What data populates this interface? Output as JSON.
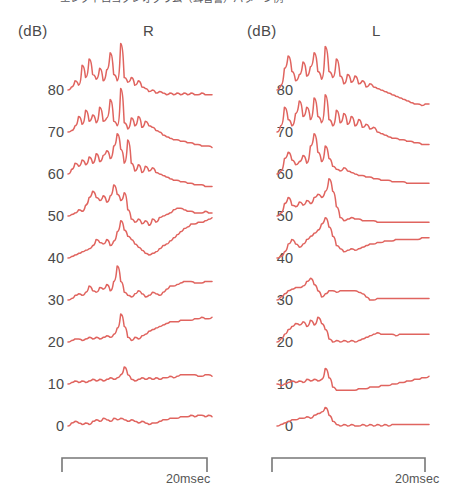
{
  "figure": {
    "caption_top": "エレクトロコクレオグラム（耳音響）パターン例",
    "unit_label": "(dB)",
    "trace_color": "#e0645f",
    "text_color": "#4a4a4a",
    "axis_color": "#777777"
  },
  "panels": [
    {
      "id": "right-ear",
      "ear_label": "R",
      "unit_label": "(dB)",
      "scale_caption": "20msec"
    },
    {
      "id": "left-ear",
      "ear_label": "L",
      "unit_label": "(dB)",
      "scale_caption": "20msec"
    }
  ],
  "chart_data": {
    "type": "line",
    "title": "",
    "xlabel": "",
    "ylabel": "(dB)",
    "grid": false,
    "legend": false,
    "x_scale_bar": {
      "label": "20msec",
      "duration_ms": 20
    },
    "y_tick_labels": [
      "80",
      "70",
      "60",
      "50",
      "40",
      "30",
      "20",
      "10",
      "0"
    ],
    "y_tick_values": [
      80,
      70,
      60,
      50,
      40,
      30,
      20,
      10,
      0
    ],
    "ylim": [
      0,
      80
    ],
    "series": [
      {
        "name": "R 80 dB",
        "panel": "right-ear",
        "level_db": 80,
        "values": [
          0,
          -2,
          -6,
          -3,
          -16,
          -8,
          -20,
          -10,
          -7,
          -14,
          -6,
          -13,
          -24,
          -10,
          -6,
          -30,
          -8,
          -5,
          -8,
          -3,
          -6,
          -2,
          -1,
          1,
          0,
          2,
          1,
          2,
          3,
          2,
          3,
          2,
          3,
          2,
          3,
          2,
          3,
          3,
          2,
          3,
          3,
          3
        ]
      },
      {
        "name": "R 70 dB",
        "panel": "right-ear",
        "level_db": 70,
        "values": [
          0,
          -1,
          -4,
          -10,
          -5,
          -14,
          -7,
          -11,
          -6,
          -16,
          -7,
          -9,
          -21,
          -7,
          -4,
          -28,
          -6,
          -2,
          -9,
          -4,
          -10,
          -3,
          -7,
          -4,
          -3,
          -1,
          0,
          2,
          3,
          4,
          5,
          5,
          6,
          6,
          7,
          7,
          8,
          8,
          9,
          9,
          9,
          10
        ]
      },
      {
        "name": "R 60 dB",
        "panel": "right-ear",
        "level_db": 60,
        "values": [
          0,
          -3,
          -7,
          -5,
          -9,
          -6,
          -11,
          -7,
          -13,
          -8,
          -12,
          -15,
          -10,
          -18,
          -26,
          -16,
          -7,
          -22,
          -7,
          -2,
          -6,
          -1,
          -5,
          -2,
          -4,
          -1,
          0,
          1,
          2,
          3,
          4,
          4,
          5,
          5,
          6,
          6,
          7,
          7,
          7,
          8,
          8,
          8
        ]
      },
      {
        "name": "R 50 dB",
        "panel": "right-ear",
        "level_db": 50,
        "values": [
          0,
          -1,
          -2,
          -4,
          -3,
          -7,
          -12,
          -16,
          -12,
          -10,
          -13,
          -9,
          -13,
          -20,
          -14,
          -10,
          -15,
          -4,
          2,
          4,
          2,
          5,
          3,
          6,
          2,
          4,
          1,
          0,
          -1,
          -2,
          -4,
          -5,
          -5,
          -4,
          -3,
          -3,
          -2,
          -2,
          -2,
          -3,
          -2,
          -2
        ]
      },
      {
        "name": "R 40 dB",
        "panel": "right-ear",
        "level_db": 40,
        "values": [
          0,
          -1,
          -2,
          -3,
          -4,
          -5,
          -6,
          -8,
          -12,
          -10,
          -9,
          -12,
          -8,
          -11,
          -17,
          -24,
          -18,
          -14,
          -12,
          -9,
          -7,
          -5,
          -3,
          -2,
          -3,
          -4,
          -6,
          -8,
          -9,
          -11,
          -13,
          -15,
          -17,
          -19,
          -20,
          -22,
          -22,
          -23,
          -23,
          -24,
          -25,
          -26
        ]
      },
      {
        "name": "R 30 dB",
        "panel": "right-ear",
        "level_db": 30,
        "values": [
          0,
          -1,
          -3,
          -4,
          -3,
          -5,
          -9,
          -6,
          -5,
          -8,
          -7,
          -10,
          -6,
          -12,
          -22,
          -12,
          -5,
          -3,
          -2,
          -4,
          -6,
          -4,
          -2,
          -3,
          -5,
          -4,
          -3,
          -5,
          -7,
          -9,
          -9,
          -10,
          -11,
          -12,
          -12,
          -12,
          -11,
          -11,
          -11,
          -12,
          -12,
          -12
        ]
      },
      {
        "name": "R 20 dB",
        "panel": "right-ear",
        "level_db": 20,
        "values": [
          0,
          -1,
          -2,
          -2,
          -1,
          -2,
          -3,
          -2,
          -3,
          -2,
          -3,
          -4,
          -3,
          -5,
          -9,
          -18,
          -10,
          -3,
          -1,
          -3,
          -2,
          -4,
          -5,
          -7,
          -8,
          -9,
          -10,
          -11,
          -12,
          -13,
          -13,
          -13,
          -14,
          -14,
          -14,
          -14,
          -15,
          -15,
          -16,
          -15,
          -15,
          -16
        ]
      },
      {
        "name": "R 10 dB",
        "panel": "right-ear",
        "level_db": 10,
        "values": [
          0,
          -1,
          -2,
          -1,
          -2,
          -1,
          -2,
          -3,
          -2,
          -3,
          -2,
          -3,
          -4,
          -3,
          -4,
          -6,
          -11,
          -6,
          -3,
          -2,
          -3,
          -4,
          -3,
          -4,
          -3,
          -4,
          -3,
          -4,
          -4,
          -5,
          -4,
          -5,
          -6,
          -6,
          -6,
          -6,
          -6,
          -5,
          -5,
          -6,
          -6,
          -5
        ]
      },
      {
        "name": "R 0 dB",
        "panel": "right-ear",
        "level_db": 0,
        "values": [
          0,
          -2,
          -3,
          -2,
          -1,
          -2,
          -1,
          -3,
          -4,
          -3,
          -5,
          -4,
          -3,
          -5,
          -4,
          -5,
          -4,
          -3,
          -4,
          -3,
          -2,
          -3,
          -2,
          -1,
          -2,
          -2,
          -3,
          -4,
          -4,
          -5,
          -5,
          -5,
          -6,
          -6,
          -6,
          -7,
          -6,
          -7,
          -7,
          -6,
          -7,
          -6
        ]
      },
      {
        "name": "L 80 dB",
        "panel": "left-ear",
        "level_db": 80,
        "values": [
          0,
          -3,
          -14,
          -22,
          -12,
          -6,
          -10,
          -18,
          -9,
          -15,
          -24,
          -12,
          -7,
          -28,
          -12,
          -8,
          -20,
          -9,
          -4,
          -10,
          -5,
          -9,
          -4,
          -6,
          -2,
          -4,
          -2,
          -1,
          0,
          1,
          2,
          3,
          4,
          5,
          6,
          7,
          8,
          9,
          9,
          10,
          9,
          9
        ]
      },
      {
        "name": "L 70 dB",
        "panel": "left-ear",
        "level_db": 70,
        "values": [
          0,
          -4,
          -16,
          -8,
          -4,
          -12,
          -20,
          -10,
          -16,
          -8,
          -22,
          -10,
          -6,
          -24,
          -8,
          -4,
          -14,
          -6,
          -12,
          -5,
          -10,
          -4,
          -8,
          -3,
          -5,
          -2,
          -3,
          0,
          1,
          2,
          3,
          4,
          4,
          5,
          5,
          6,
          6,
          7,
          7,
          8,
          8,
          8
        ]
      },
      {
        "name": "L 60 dB",
        "panel": "left-ear",
        "level_db": 60,
        "values": [
          0,
          -2,
          -10,
          -14,
          -9,
          -6,
          -8,
          -12,
          -7,
          -18,
          -26,
          -14,
          -8,
          -18,
          -10,
          -5,
          -3,
          -2,
          -4,
          -2,
          -1,
          0,
          1,
          1,
          2,
          2,
          3,
          3,
          4,
          4,
          4,
          5,
          5,
          5,
          5,
          6,
          6,
          6,
          6,
          6,
          6,
          6
        ]
      },
      {
        "name": "L 50 dB",
        "panel": "left-ear",
        "level_db": 50,
        "values": [
          0,
          -2,
          -8,
          -12,
          -7,
          -6,
          -9,
          -7,
          -10,
          -8,
          -12,
          -14,
          -12,
          -16,
          -24,
          -16,
          -6,
          1,
          3,
          2,
          1,
          2,
          2,
          3,
          3,
          3,
          3,
          4,
          4,
          4,
          4,
          4,
          4,
          4,
          4,
          4,
          4,
          4,
          4,
          4,
          4,
          4
        ]
      },
      {
        "name": "L 40 dB",
        "panel": "left-ear",
        "level_db": 40,
        "values": [
          0,
          -1,
          -4,
          -9,
          -12,
          -9,
          -7,
          -9,
          -12,
          -14,
          -16,
          -18,
          -22,
          -26,
          -20,
          -14,
          -8,
          -6,
          -4,
          -5,
          -6,
          -5,
          -6,
          -7,
          -8,
          -9,
          -9,
          -10,
          -10,
          -11,
          -11,
          -11,
          -12,
          -12,
          -12,
          -12,
          -12,
          -12,
          -12,
          -13,
          -13,
          -13
        ]
      },
      {
        "name": "L 30 dB",
        "panel": "left-ear",
        "level_db": 30,
        "values": [
          0,
          -2,
          -4,
          -6,
          -7,
          -8,
          -8,
          -9,
          -12,
          -14,
          -10,
          -6,
          -2,
          -4,
          -6,
          -6,
          -5,
          -6,
          -6,
          -6,
          -6,
          -6,
          -5,
          -4,
          -2,
          0,
          0,
          -1,
          -1,
          -1,
          -1,
          -1,
          -1,
          -1,
          -1,
          -1,
          -1,
          -1,
          -1,
          -1,
          -1,
          -1
        ]
      },
      {
        "name": "L 20 dB",
        "panel": "left-ear",
        "level_db": 20,
        "values": [
          0,
          -2,
          -5,
          -8,
          -10,
          -12,
          -11,
          -13,
          -10,
          -14,
          -11,
          -16,
          -12,
          -8,
          -2,
          0,
          -1,
          0,
          -1,
          0,
          -1,
          0,
          -1,
          -2,
          -3,
          -4,
          -5,
          -6,
          -5,
          -5,
          -5,
          -5,
          -4,
          -5,
          -5,
          -5,
          -5,
          -5,
          -5,
          -5,
          -5,
          -5
        ]
      },
      {
        "name": "L 10 dB",
        "panel": "left-ear",
        "level_db": 10,
        "values": [
          0,
          1,
          0,
          -1,
          -2,
          -1,
          -2,
          -1,
          -3,
          -2,
          -3,
          -2,
          -3,
          -10,
          -4,
          2,
          4,
          4,
          4,
          4,
          4,
          4,
          3,
          3,
          3,
          2,
          2,
          2,
          1,
          1,
          1,
          0,
          0,
          -1,
          -1,
          -2,
          -2,
          -3,
          -3,
          -4,
          -4,
          -5
        ]
      },
      {
        "name": "L 0 dB",
        "panel": "left-ear",
        "level_db": 0,
        "values": [
          0,
          -1,
          -2,
          -3,
          -4,
          -4,
          -5,
          -5,
          -6,
          -5,
          -7,
          -8,
          -9,
          -12,
          -7,
          -3,
          -1,
          0,
          -1,
          0,
          -1,
          0,
          0,
          -1,
          0,
          -1,
          0,
          -1,
          0,
          -1,
          0,
          -1,
          -1,
          -1,
          -1,
          -1,
          -1,
          -1,
          -1,
          -1,
          -1,
          -1
        ]
      }
    ]
  }
}
